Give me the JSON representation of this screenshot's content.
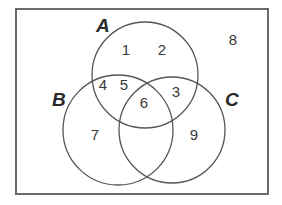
{
  "diagram": {
    "type": "venn",
    "universe": {
      "x": 16,
      "y": 9,
      "width": 252,
      "height": 185,
      "stroke_color": "#6a6a6a"
    },
    "sets": [
      {
        "label": "A",
        "cx": 145,
        "cy": 75,
        "r": 53,
        "label_x": 96,
        "label_y": 32
      },
      {
        "label": "B",
        "cx": 118,
        "cy": 130,
        "r": 55,
        "label_x": 52,
        "label_y": 106
      },
      {
        "label": "C",
        "cx": 172,
        "cy": 130,
        "r": 53,
        "label_x": 225,
        "label_y": 106
      }
    ],
    "regions": [
      {
        "value": "1",
        "membership": "A only",
        "x": 126,
        "y": 55
      },
      {
        "value": "2",
        "membership": "A only",
        "x": 162,
        "y": 55
      },
      {
        "value": "8",
        "membership": "outside A, B, C",
        "x": 233,
        "y": 45
      },
      {
        "value": "4",
        "membership": "A and B only",
        "x": 103,
        "y": 90
      },
      {
        "value": "5",
        "membership": "A and B only",
        "x": 124,
        "y": 90
      },
      {
        "value": "3",
        "membership": "A and C only",
        "x": 176,
        "y": 97
      },
      {
        "value": "6",
        "membership": "A, B and C",
        "x": 144,
        "y": 108
      },
      {
        "value": "7",
        "membership": "B only",
        "x": 95,
        "y": 140
      },
      {
        "value": "9",
        "membership": "C only",
        "x": 194,
        "y": 140
      }
    ]
  },
  "labels": {
    "set_a": "A",
    "set_b": "B",
    "set_c": "C",
    "region_1": "1",
    "region_2": "2",
    "region_3": "3",
    "region_4": "4",
    "region_5": "5",
    "region_6": "6",
    "region_7": "7",
    "region_8": "8",
    "region_9": "9"
  }
}
